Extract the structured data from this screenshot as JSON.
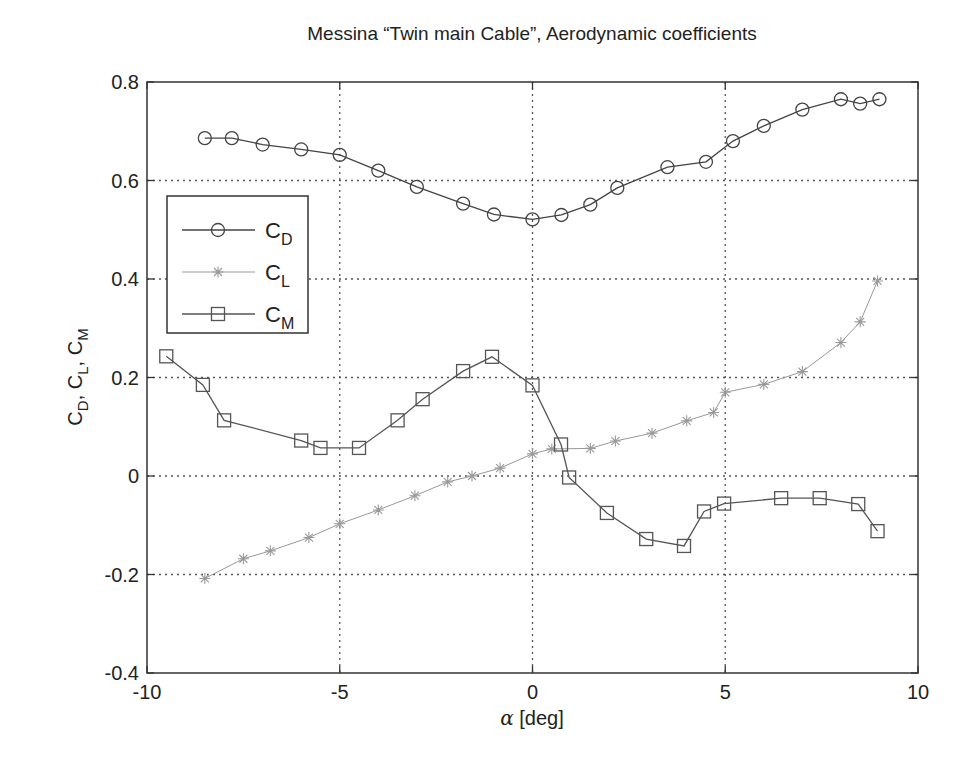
{
  "chart_data": {
    "type": "line",
    "title": "Messina “Twin main Cable”, Aerodynamic coefficients",
    "xlabel": "α [deg]",
    "xlabel_parts": {
      "symbol": "α",
      "unit": " [deg]"
    },
    "ylabel": "C_D, C_L, C_M",
    "xlim": [
      -10,
      10
    ],
    "ylim": [
      -0.4,
      0.8
    ],
    "xticks": [
      -10,
      -5,
      0,
      5,
      10
    ],
    "xtick_labels": [
      "-10",
      "-5",
      "0",
      "5",
      "10"
    ],
    "yticks": [
      -0.4,
      -0.2,
      0,
      0.2,
      0.4,
      0.6,
      0.8
    ],
    "ytick_labels": [
      "-0.4",
      "-0.2",
      "0",
      "0.2",
      "0.4",
      "0.6",
      "0.8"
    ],
    "grid": true,
    "legend_position": "upper left (inside)",
    "series": [
      {
        "name": "C_D",
        "label_main": "C",
        "label_sub": "D",
        "marker": "circle",
        "color": "#444444",
        "x": [
          -8.5,
          -7.8,
          -7.0,
          -6.0,
          -5.0,
          -4.0,
          -3.0,
          -1.8,
          -1.0,
          0.0,
          0.75,
          1.5,
          2.2,
          3.5,
          4.5,
          5.2,
          6.0,
          7.0,
          8.0,
          8.5,
          9.0
        ],
        "y": [
          0.686,
          0.686,
          0.673,
          0.663,
          0.652,
          0.62,
          0.587,
          0.553,
          0.531,
          0.521,
          0.53,
          0.551,
          0.585,
          0.627,
          0.638,
          0.68,
          0.711,
          0.744,
          0.765,
          0.756,
          0.765
        ]
      },
      {
        "name": "C_L",
        "label_main": "C",
        "label_sub": "L",
        "marker": "asterisk",
        "color": "#999999",
        "x": [
          -8.5,
          -7.5,
          -6.8,
          -5.8,
          -5.0,
          -4.0,
          -3.05,
          -2.2,
          -1.57,
          -0.84,
          0.0,
          0.5,
          1.5,
          2.15,
          3.1,
          4.0,
          4.7,
          5.0,
          6.0,
          7.0,
          8.0,
          8.5,
          8.95
        ],
        "y": [
          -0.208,
          -0.168,
          -0.152,
          -0.125,
          -0.097,
          -0.069,
          -0.04,
          -0.012,
          0.0,
          0.016,
          0.045,
          0.055,
          0.056,
          0.071,
          0.087,
          0.112,
          0.129,
          0.17,
          0.186,
          0.212,
          0.271,
          0.313,
          0.396
        ]
      },
      {
        "name": "C_M",
        "label_main": "C",
        "label_sub": "M",
        "marker": "square",
        "color": "#555555",
        "x": [
          -9.5,
          -8.55,
          -8.0,
          -6.0,
          -5.5,
          -4.5,
          -3.5,
          -2.85,
          -1.8,
          -1.05,
          0.0,
          0.74,
          0.95,
          1.93,
          2.95,
          3.93,
          4.45,
          4.97,
          6.45,
          7.45,
          8.45,
          8.95
        ],
        "y": [
          0.243,
          0.185,
          0.113,
          0.072,
          0.057,
          0.057,
          0.113,
          0.156,
          0.213,
          0.242,
          0.184,
          0.064,
          -0.003,
          -0.075,
          -0.128,
          -0.142,
          -0.072,
          -0.056,
          -0.045,
          -0.045,
          -0.057,
          -0.112
        ]
      }
    ]
  }
}
